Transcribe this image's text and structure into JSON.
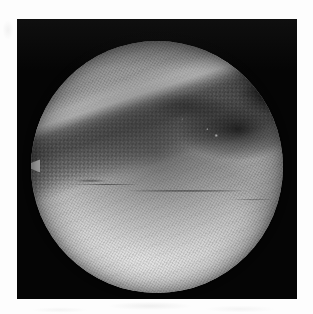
{
  "document": {
    "kind": "scanned-photograph",
    "page_background_color": "#fdfdfd"
  },
  "photo": {
    "frame_color": "#050505",
    "frame_left_px": 17,
    "frame_top_px": 19,
    "frame_width_px": 280,
    "frame_height_px": 280,
    "modality_label": "arthroscopic view",
    "color_mode": "grayscale"
  },
  "scope_view": {
    "shape": "circle",
    "center_x_px": 157,
    "center_y_px": 167,
    "radius_px": 126,
    "tissue_highlight_color": "#f4f4f4",
    "tissue_midtone_color": "#d2d2d2",
    "shadow_color": "#141414"
  },
  "features": [
    {
      "id": "upper-left-lobe",
      "label": "bright upper-left tissue lobe",
      "tone": "highlight"
    },
    {
      "id": "diagonal-cleft",
      "label": "dark diagonal cleft running lower-left to upper-right",
      "tone": "shadow"
    },
    {
      "id": "shadow-pocket",
      "label": "deep shadow pocket at upper right",
      "tone": "deep-shadow"
    },
    {
      "id": "ridge-highlight",
      "label": "bright specular ridge along the cleft margin",
      "tone": "specular"
    },
    {
      "id": "mid-crease",
      "label": "thin dark horizontal crease across lower tissue",
      "tone": "line"
    },
    {
      "id": "left-spur",
      "label": "small pointed tissue spur at left rim",
      "tone": "midtone"
    }
  ],
  "texture": {
    "pattern": "fine diagonal halftone mesh",
    "artifact": "8x8 block compression checkerboard in dark regions"
  }
}
